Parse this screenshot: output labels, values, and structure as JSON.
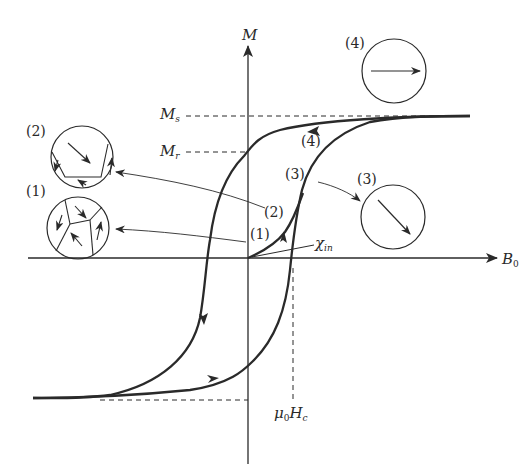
{
  "axes": {
    "y_label": "M",
    "x_label": "B",
    "x_label_sub": "0"
  },
  "levels": {
    "saturation": "M",
    "saturation_sub": "s",
    "remanence": "M",
    "remanence_sub": "r",
    "coercive": "μ",
    "coercive_sub": "0",
    "coercive_main": "H",
    "coercive_sub2": "c"
  },
  "initial_susceptibility": {
    "symbol": "χ",
    "sub": "in"
  },
  "curve_labels": [
    "(1)",
    "(2)",
    "(3)",
    "(4)"
  ],
  "domain_states": [
    {
      "id": "1",
      "label": "(1)",
      "description": "multiple domains, randomly oriented"
    },
    {
      "id": "2",
      "label": "(2)",
      "description": "dominant domain growing along field"
    },
    {
      "id": "3",
      "label": "(3)",
      "description": "single domain, rotated diagonal"
    },
    {
      "id": "4",
      "label": "(4)",
      "description": "single domain aligned with field"
    }
  ],
  "colors": {
    "ink": "#2a2a2a",
    "background": "#ffffff"
  }
}
